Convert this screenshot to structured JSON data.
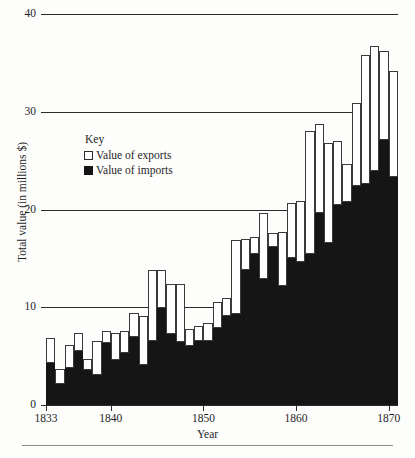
{
  "axes": {
    "x_title": "Year",
    "y_title": "Total value (in millions $)",
    "y_ticks": [
      "0",
      "10",
      "20",
      "30",
      "40"
    ],
    "x_ticks": [
      "1833",
      "1840",
      "1850",
      "1860",
      "1870"
    ]
  },
  "legend": {
    "title": "Key",
    "exports_label": "Value of exports",
    "imports_label": "Value of imports",
    "exports_color": "#ffffff",
    "imports_color": "#151515"
  },
  "chart_data": {
    "type": "bar",
    "title": "",
    "subtitle": "",
    "xlabel": "Year",
    "ylabel": "Total value (in millions $)",
    "ylim": [
      0,
      40
    ],
    "xlim": [
      1833,
      1870
    ],
    "grid": true,
    "stacked": true,
    "legend_position": "inside-upper-left",
    "categories": [
      "1833",
      "1834",
      "1835",
      "1836",
      "1837",
      "1838",
      "1839",
      "1840",
      "1841",
      "1842",
      "1843",
      "1844",
      "1845",
      "1846",
      "1847",
      "1848",
      "1849",
      "1850",
      "1851",
      "1852",
      "1853",
      "1854",
      "1855",
      "1856",
      "1857",
      "1858",
      "1859",
      "1860",
      "1861",
      "1862",
      "1863",
      "1864",
      "1865",
      "1866",
      "1867",
      "1868",
      "1869",
      "1870"
    ],
    "series": [
      {
        "name": "Value of imports",
        "color": "#151515",
        "values": [
          4.3,
          2.2,
          3.8,
          5.5,
          3.6,
          3.1,
          6.3,
          4.6,
          5.3,
          7.0,
          4.1,
          6.6,
          9.9,
          7.3,
          6.4,
          6.0,
          6.6,
          6.6,
          7.9,
          9.1,
          9.3,
          13.8,
          15.4,
          12.9,
          16.2,
          12.2,
          15.0,
          14.6,
          15.4,
          19.6,
          16.6,
          20.5,
          20.8,
          22.4,
          22.6,
          23.9,
          27.1,
          23.3
        ]
      },
      {
        "name": "Value of exports",
        "color": "#ffffff",
        "values": [
          2.6,
          1.5,
          2.3,
          1.9,
          1.1,
          3.4,
          1.3,
          2.8,
          2.3,
          2.4,
          5.0,
          7.2,
          3.9,
          5.1,
          6.0,
          1.8,
          1.5,
          1.8,
          2.6,
          1.8,
          7.6,
          3.2,
          1.8,
          6.7,
          1.4,
          5.5,
          5.7,
          6.3,
          12.6,
          9.1,
          10.2,
          6.5,
          3.9,
          8.5,
          13.2,
          12.8,
          9.1,
          10.9
        ]
      }
    ],
    "totals": [
      6.9,
      3.7,
      6.1,
      7.4,
      4.7,
      6.5,
      7.6,
      7.4,
      7.6,
      9.4,
      9.1,
      13.8,
      13.8,
      12.4,
      12.4,
      7.8,
      8.1,
      8.4,
      10.5,
      10.9,
      16.9,
      17.0,
      17.2,
      19.6,
      17.6,
      17.7,
      20.7,
      20.9,
      28.0,
      28.7,
      26.8,
      27.0,
      24.7,
      30.9,
      35.8,
      36.7,
      36.2,
      34.2
    ]
  }
}
